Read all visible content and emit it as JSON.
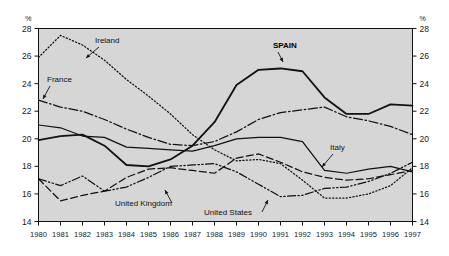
{
  "chart_data": {
    "type": "line",
    "title": "",
    "xlabel": "",
    "ylabel": "%",
    "y_unit_label": "%",
    "xlim": [
      1980,
      1997
    ],
    "ylim": [
      14,
      28
    ],
    "y_ticks": [
      14,
      16,
      18,
      20,
      22,
      24,
      26,
      28
    ],
    "x_ticks": [
      1980,
      1981,
      1982,
      1983,
      1984,
      1985,
      1986,
      1987,
      1988,
      1989,
      1990,
      1991,
      1992,
      1993,
      1994,
      1995,
      1996,
      1997
    ],
    "grid": false,
    "legend_position": "inline-annotations",
    "plot_background": "#d6d6d6",
    "line_color": "#111111",
    "x": [
      1980,
      1981,
      1982,
      1983,
      1984,
      1985,
      1986,
      1987,
      1988,
      1989,
      1990,
      1991,
      1992,
      1993,
      1994,
      1995,
      1996,
      1997
    ],
    "series": [
      {
        "name": "SPAIN",
        "style": "solid-bold",
        "values": [
          19.9,
          20.2,
          20.3,
          19.5,
          18.1,
          18.0,
          18.5,
          19.5,
          21.2,
          23.9,
          25.0,
          25.1,
          24.9,
          23.0,
          21.8,
          21.8,
          22.5,
          22.4
        ]
      },
      {
        "name": "Ireland",
        "style": "dotted",
        "values": [
          25.9,
          27.5,
          26.8,
          25.7,
          24.3,
          23.1,
          21.8,
          20.3,
          19.2,
          18.4,
          18.5,
          18.2,
          17.0,
          15.7,
          15.7,
          16.0,
          16.6,
          17.9
        ]
      },
      {
        "name": "France",
        "style": "dash-dot",
        "values": [
          22.8,
          22.3,
          22.0,
          21.4,
          20.7,
          20.1,
          19.6,
          19.5,
          19.8,
          20.5,
          21.4,
          21.9,
          22.1,
          22.3,
          21.6,
          21.3,
          20.9,
          20.3
        ]
      },
      {
        "name": "Italy",
        "style": "solid",
        "values": [
          21.0,
          20.8,
          20.2,
          20.1,
          19.4,
          19.3,
          19.2,
          19.1,
          19.5,
          20.0,
          20.1,
          20.1,
          19.8,
          17.7,
          17.5,
          17.8,
          18.0,
          17.6
        ]
      },
      {
        "name": "United Kingdom",
        "style": "dashed",
        "values": [
          17.1,
          15.5,
          15.9,
          16.2,
          17.2,
          17.8,
          17.9,
          17.7,
          17.5,
          18.6,
          18.9,
          18.3,
          17.6,
          17.2,
          17.0,
          17.1,
          17.4,
          17.7
        ]
      },
      {
        "name": "United States",
        "style": "dash-dot-dot",
        "values": [
          17.1,
          16.6,
          17.3,
          16.2,
          16.5,
          17.2,
          18.0,
          18.1,
          18.2,
          17.6,
          16.7,
          15.8,
          15.9,
          16.4,
          16.5,
          16.9,
          17.5,
          18.3
        ]
      }
    ],
    "annotations": [
      {
        "label": "Ireland",
        "bold": false,
        "text_x": 95,
        "text_y": 43,
        "arrow_from_x": 99,
        "arrow_from_y": 47,
        "arrow_to_x": 86,
        "arrow_to_y": 58
      },
      {
        "label": "France",
        "bold": false,
        "text_x": 47,
        "text_y": 82,
        "arrow_from_x": 50,
        "arrow_from_y": 86,
        "arrow_to_x": 43,
        "arrow_to_y": 99
      },
      {
        "label": "SPAIN",
        "bold": true,
        "text_x": 273,
        "text_y": 48,
        "arrow_from_x": 278,
        "arrow_from_y": 52,
        "arrow_to_x": 283,
        "arrow_to_y": 62
      },
      {
        "label": "Italy",
        "bold": false,
        "text_x": 330,
        "text_y": 150,
        "arrow_from_x": 333,
        "arrow_from_y": 154,
        "arrow_to_x": 322,
        "arrow_to_y": 167
      },
      {
        "label": "United Kingdom",
        "bold": false,
        "text_x": 115,
        "text_y": 206,
        "arrow_from_x": 172,
        "arrow_from_y": 203,
        "arrow_to_x": 165,
        "arrow_to_y": 190
      },
      {
        "label": "United States",
        "bold": false,
        "text_x": 204,
        "text_y": 215,
        "arrow_from_x": 262,
        "arrow_from_y": 212,
        "arrow_to_x": 268,
        "arrow_to_y": 200
      }
    ]
  }
}
